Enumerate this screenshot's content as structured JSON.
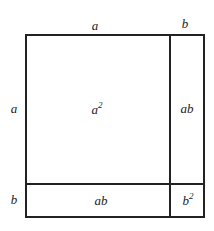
{
  "diagram": {
    "title": "",
    "top_labels": {
      "a": "a",
      "b": "b"
    },
    "side_labels": {
      "a": "a",
      "b": "b"
    },
    "regions": {
      "a_squared": {
        "base": "a",
        "exp": "2"
      },
      "ab_right": "ab",
      "ab_bottom": "ab",
      "b_squared": {
        "base": "b",
        "exp": "2"
      }
    }
  }
}
